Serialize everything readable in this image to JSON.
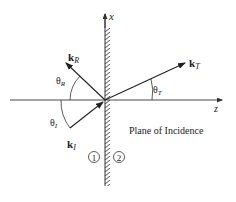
{
  "axes": {
    "x_label": "x",
    "z_label": "z"
  },
  "vectors": {
    "reflected": {
      "symbol": "k",
      "subscript": "R"
    },
    "incident": {
      "symbol": "k",
      "subscript": "I"
    },
    "transmitted": {
      "symbol": "k",
      "subscript": "T"
    }
  },
  "angles": {
    "reflected": {
      "symbol": "θ",
      "subscript": "R"
    },
    "incident": {
      "symbol": "θ",
      "subscript": "I"
    },
    "transmitted": {
      "symbol": "θ",
      "subscript": "T"
    }
  },
  "plane_label": "Plane of Incidence",
  "media": {
    "medium_1": "1",
    "medium_2": "2"
  },
  "colors": {
    "line": "#222222",
    "hatch": "#333333",
    "background": "#ffffff"
  }
}
